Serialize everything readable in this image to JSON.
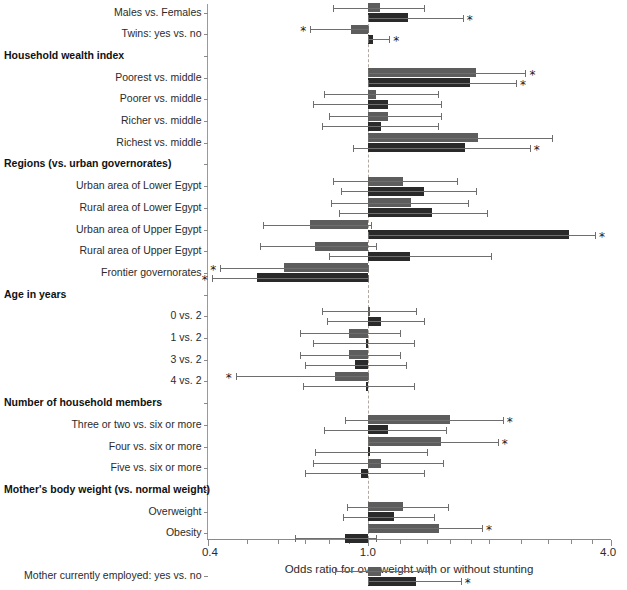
{
  "chart_data": {
    "type": "bar",
    "title": "",
    "xlabel": "Odds ratio for overweight with or without stunting",
    "ylabel": "",
    "scale": "log",
    "xlim": [
      0.4,
      4.0
    ],
    "xticks_labeled": [
      "0.4",
      "1.0",
      "4.0"
    ],
    "xtick_values": [
      0.4,
      1.0,
      4.0
    ],
    "reference_line": 1.0,
    "grid": false,
    "legend_position": "none",
    "series": [
      {
        "name": "overweight without stunting",
        "color": "#5d5d5d"
      },
      {
        "name": "overweight with stunting",
        "color": "#2a2a2a"
      }
    ],
    "significance_marker": "*",
    "rows": [
      {
        "label": "Males vs. Females",
        "type": "item",
        "a": {
          "or": 1.07,
          "lo": 0.82,
          "hi": 1.38,
          "sig": false
        },
        "b": {
          "or": 1.26,
          "lo": 1.0,
          "hi": 1.72,
          "sig": true
        }
      },
      {
        "label": "Twins: yes vs. no",
        "type": "item",
        "a": {
          "or": 0.91,
          "lo": 0.72,
          "hi": 1.0,
          "sig": true
        },
        "b": {
          "or": 1.03,
          "lo": 1.0,
          "hi": 1.13,
          "sig": true
        }
      },
      {
        "label": "Household wealth index",
        "type": "header"
      },
      {
        "label": "Poorest vs. middle",
        "type": "item",
        "a": {
          "or": 1.86,
          "lo": 1.0,
          "hi": 2.46,
          "sig": true
        },
        "b": {
          "or": 1.79,
          "lo": 1.0,
          "hi": 2.33,
          "sig": true
        }
      },
      {
        "label": "Poorer vs. middle",
        "type": "item",
        "a": {
          "or": 1.05,
          "lo": 0.78,
          "hi": 1.49,
          "sig": false
        },
        "b": {
          "or": 1.12,
          "lo": 0.73,
          "hi": 1.52,
          "sig": false
        }
      },
      {
        "label": "Richer vs. middle",
        "type": "item",
        "a": {
          "or": 1.12,
          "lo": 0.8,
          "hi": 1.52,
          "sig": false
        },
        "b": {
          "or": 1.08,
          "lo": 0.77,
          "hi": 1.49,
          "sig": false
        }
      },
      {
        "label": "Richest vs. middle",
        "type": "item",
        "a": {
          "or": 1.88,
          "lo": 1.0,
          "hi": 2.86,
          "sig": false
        },
        "b": {
          "or": 1.74,
          "lo": 0.92,
          "hi": 2.52,
          "sig": true
        }
      },
      {
        "label": "Regions (vs. urban governorates)",
        "type": "header"
      },
      {
        "label": "Urban area of Lower Egypt",
        "type": "item",
        "a": {
          "or": 1.22,
          "lo": 0.82,
          "hi": 1.66,
          "sig": false
        },
        "b": {
          "or": 1.38,
          "lo": 0.86,
          "hi": 1.86,
          "sig": false
        }
      },
      {
        "label": "Rural area of Lower Egypt",
        "type": "item",
        "a": {
          "or": 1.28,
          "lo": 0.81,
          "hi": 1.77,
          "sig": false
        },
        "b": {
          "or": 1.44,
          "lo": 0.85,
          "hi": 1.98,
          "sig": false
        }
      },
      {
        "label": "Urban area of Upper Egypt",
        "type": "item",
        "a": {
          "or": 0.72,
          "lo": 0.55,
          "hi": 1.02,
          "sig": false
        },
        "b": {
          "or": 3.15,
          "lo": 1.0,
          "hi": 3.66,
          "sig": true
        }
      },
      {
        "label": "Rural area of Upper Egypt",
        "type": "item",
        "a": {
          "or": 0.74,
          "lo": 0.54,
          "hi": 1.05,
          "sig": false
        },
        "b": {
          "or": 1.27,
          "lo": 0.8,
          "hi": 2.02,
          "sig": false
        }
      },
      {
        "label": "Frontier governorates",
        "type": "item",
        "a": {
          "or": 0.62,
          "lo": 0.43,
          "hi": 1.0,
          "sig": true
        },
        "b": {
          "or": 0.53,
          "lo": 0.41,
          "hi": 1.0,
          "sig": true
        }
      },
      {
        "label": "Age in years",
        "type": "header"
      },
      {
        "label": "0 vs. 2",
        "type": "item",
        "a": {
          "or": 1.01,
          "lo": 0.77,
          "hi": 1.32,
          "sig": false
        },
        "b": {
          "or": 1.08,
          "lo": 0.79,
          "hi": 1.38,
          "sig": false
        }
      },
      {
        "label": "1 vs. 2",
        "type": "item",
        "a": {
          "or": 0.9,
          "lo": 0.68,
          "hi": 1.2,
          "sig": false
        },
        "b": {
          "or": 0.99,
          "lo": 0.73,
          "hi": 1.3,
          "sig": false
        }
      },
      {
        "label": "3 vs. 2",
        "type": "item",
        "a": {
          "or": 0.9,
          "lo": 0.68,
          "hi": 1.2,
          "sig": false
        },
        "b": {
          "or": 0.93,
          "lo": 0.7,
          "hi": 1.24,
          "sig": false
        }
      },
      {
        "label": "4 vs. 2",
        "type": "item",
        "a": {
          "or": 0.83,
          "lo": 0.47,
          "hi": 1.0,
          "sig": true
        },
        "b": {
          "or": 0.99,
          "lo": 0.69,
          "hi": 1.3,
          "sig": false
        }
      },
      {
        "label": "Number of household members",
        "type": "header"
      },
      {
        "label": "Three or two vs. six or more",
        "type": "item",
        "a": {
          "or": 1.6,
          "lo": 0.88,
          "hi": 2.16,
          "sig": true
        },
        "b": {
          "or": 1.12,
          "lo": 0.78,
          "hi": 1.56,
          "sig": false
        }
      },
      {
        "label": "Four vs. six or more",
        "type": "item",
        "a": {
          "or": 1.52,
          "lo": 1.0,
          "hi": 2.1,
          "sig": true
        },
        "b": {
          "or": 1.01,
          "lo": 0.74,
          "hi": 1.4,
          "sig": false
        }
      },
      {
        "label": "Five vs. six or more",
        "type": "item",
        "a": {
          "or": 1.08,
          "lo": 0.73,
          "hi": 1.54,
          "sig": false
        },
        "b": {
          "or": 0.96,
          "lo": 0.7,
          "hi": 1.38,
          "sig": false
        }
      },
      {
        "label": "Mother's body weight (vs. normal weight)",
        "type": "header"
      },
      {
        "label": "Overweight",
        "type": "item",
        "a": {
          "or": 1.22,
          "lo": 0.89,
          "hi": 1.58,
          "sig": false
        },
        "b": {
          "or": 1.16,
          "lo": 0.87,
          "hi": 1.46,
          "sig": false
        }
      },
      {
        "label": "Obesity",
        "type": "item",
        "a": {
          "or": 1.5,
          "lo": 1.0,
          "hi": 1.92,
          "sig": true
        },
        "b": {
          "or": 0.88,
          "lo": 0.66,
          "hi": 1.05,
          "sig": false
        }
      },
      {
        "label": "",
        "type": "spacer"
      },
      {
        "label": "Mother currently employed: yes vs. no",
        "type": "item",
        "a": {
          "or": 1.08,
          "lo": 0.83,
          "hi": 1.42,
          "sig": false
        },
        "b": {
          "or": 1.32,
          "lo": 1.0,
          "hi": 1.7,
          "sig": true
        }
      }
    ]
  }
}
